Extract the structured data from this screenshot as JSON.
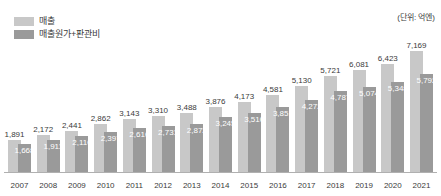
{
  "unit_caption": "(단위: 억엔)",
  "legend": {
    "items": [
      {
        "label": "매출",
        "color": "#c8c8c8",
        "icon": "legend-swatch-icon"
      },
      {
        "label": "매출원가+판관비",
        "color": "#9a9a9a",
        "icon": "legend-swatch-icon"
      }
    ]
  },
  "chart_data": {
    "type": "bar",
    "title": "",
    "subtitle": "",
    "xlabel": "",
    "ylabel": "",
    "unit": "억엔",
    "grid": false,
    "legend_position": "top-left",
    "ylim": [
      0,
      7600
    ],
    "categories": [
      "2007",
      "2008",
      "2009",
      "2010",
      "2011",
      "2012",
      "2013",
      "2014",
      "2015",
      "2016",
      "2017",
      "2018",
      "2019",
      "2020",
      "2021"
    ],
    "series": [
      {
        "name": "매출",
        "color": "#c8c8c8",
        "values": [
          1891,
          2172,
          2441,
          2862,
          3143,
          3310,
          3488,
          3876,
          4173,
          4581,
          5130,
          5721,
          6081,
          6423,
          7169
        ],
        "labels": [
          "1,891",
          "2,172",
          "2,441",
          "2,862",
          "3,143",
          "3,310",
          "3,488",
          "3,876",
          "4,173",
          "4,581",
          "5,130",
          "5,721",
          "6,081",
          "6,423",
          "7,169"
        ]
      },
      {
        "name": "매출원가+판관비",
        "color": "#9a9a9a",
        "values": [
          1668,
          1911,
          2110,
          2397,
          2616,
          2731,
          2872,
          3245,
          3510,
          3851,
          4272,
          4787,
          5074,
          5348,
          5792
        ],
        "labels": [
          "1,668",
          "1,911",
          "2,110",
          "2,397",
          "2,616",
          "2,731",
          "2,872",
          "3,245",
          "3,510",
          "3,851",
          "4,272",
          "4,787",
          "5,074",
          "5,348",
          "5,792"
        ]
      }
    ]
  }
}
